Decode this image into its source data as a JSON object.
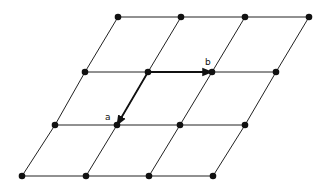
{
  "diagram": {
    "type": "2D lattice with basis vectors",
    "line_color": "#222222",
    "node_color": "#111111",
    "rows": [
      [
        [
          118,
          17
        ],
        [
          181,
          17
        ],
        [
          245,
          17
        ],
        [
          309,
          17
        ]
      ],
      [
        [
          85,
          72
        ],
        [
          148,
          72
        ],
        [
          212,
          72
        ],
        [
          276,
          72
        ]
      ],
      [
        [
          55,
          125
        ],
        [
          117,
          125
        ],
        [
          180,
          125
        ],
        [
          245,
          125
        ]
      ],
      [
        [
          22,
          176
        ],
        [
          86,
          176
        ],
        [
          149,
          176
        ],
        [
          213,
          176
        ]
      ]
    ],
    "vectors": [
      {
        "name": "a",
        "from": [
          148,
          72
        ],
        "to": [
          117,
          125
        ],
        "label": "a",
        "label_pos": [
          105,
          113
        ]
      },
      {
        "name": "b",
        "from": [
          148,
          72
        ],
        "to": [
          212,
          72
        ],
        "label": "b",
        "label_pos": [
          205,
          58
        ]
      }
    ]
  }
}
